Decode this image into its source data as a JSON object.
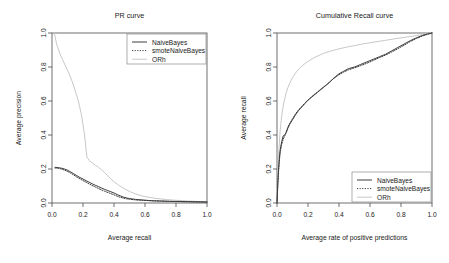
{
  "figure": {
    "background": "#ffffff",
    "panels": 2
  },
  "colors": {
    "naive_bayes": "#3d3d3d",
    "smote_naive_bayes": "#3d3d3d",
    "orh": "#c8c8c8",
    "axis": "#4d4d4d",
    "text": "#1a1a1a",
    "legend_border": "#8c8c8c"
  },
  "legend": {
    "entries": [
      {
        "label": "NaiveBayes",
        "style": "solid",
        "color_key": "naive_bayes"
      },
      {
        "label": "smoteNaiveBayes",
        "style": "dotted",
        "color_key": "smote_naive_bayes"
      },
      {
        "label": "ORh",
        "style": "solid",
        "color_key": "orh"
      }
    ],
    "left_position": "top-right",
    "right_position": "bottom-right"
  },
  "chart_data": [
    {
      "type": "line",
      "title": "PR curve",
      "xlabel": "Average recall",
      "ylabel": "Average precision",
      "xlim": [
        0.0,
        1.0
      ],
      "ylim": [
        0.0,
        1.0
      ],
      "xticks": [
        "0.0",
        "0.2",
        "0.4",
        "0.6",
        "0.8",
        "1.0"
      ],
      "yticks": [
        "0.0",
        "0.2",
        "0.4",
        "0.6",
        "0.8",
        "1.0"
      ],
      "xtick_values": [
        0.0,
        0.2,
        0.4,
        0.6,
        0.8,
        1.0
      ],
      "ytick_values": [
        0.0,
        0.2,
        0.4,
        0.6,
        0.8,
        1.0
      ],
      "grid": false,
      "legend": "top-right",
      "series": [
        {
          "name": "NaiveBayes",
          "style": "solid",
          "color_key": "naive_bayes",
          "x": [
            0.02,
            0.04,
            0.06,
            0.08,
            0.1,
            0.12,
            0.14,
            0.16,
            0.18,
            0.2,
            0.22,
            0.24,
            0.26,
            0.28,
            0.3,
            0.32,
            0.34,
            0.36,
            0.38,
            0.4,
            0.42,
            0.44,
            0.46,
            0.48,
            0.5,
            0.54,
            0.58,
            0.62,
            0.66,
            0.7,
            0.76,
            0.82,
            0.88,
            0.94,
            1.0
          ],
          "y": [
            0.21,
            0.208,
            0.205,
            0.2,
            0.193,
            0.183,
            0.172,
            0.161,
            0.15,
            0.141,
            0.131,
            0.122,
            0.113,
            0.104,
            0.096,
            0.088,
            0.08,
            0.073,
            0.066,
            0.059,
            0.05,
            0.042,
            0.035,
            0.03,
            0.026,
            0.021,
            0.018,
            0.015,
            0.013,
            0.012,
            0.01,
            0.009,
            0.008,
            0.007,
            0.006
          ]
        },
        {
          "name": "smoteNaiveBayes",
          "style": "dotted",
          "color_key": "smote_naive_bayes",
          "x": [
            0.02,
            0.04,
            0.06,
            0.08,
            0.1,
            0.12,
            0.14,
            0.16,
            0.18,
            0.2,
            0.22,
            0.24,
            0.26,
            0.28,
            0.3,
            0.32,
            0.34,
            0.36,
            0.38,
            0.4,
            0.42,
            0.44,
            0.46,
            0.48,
            0.5,
            0.54,
            0.58,
            0.62,
            0.66,
            0.7,
            0.76,
            0.82,
            0.88,
            0.94,
            1.0
          ],
          "y": [
            0.206,
            0.204,
            0.2,
            0.194,
            0.186,
            0.176,
            0.165,
            0.153,
            0.142,
            0.132,
            0.122,
            0.112,
            0.103,
            0.094,
            0.085,
            0.077,
            0.069,
            0.062,
            0.055,
            0.048,
            0.04,
            0.034,
            0.029,
            0.025,
            0.022,
            0.018,
            0.016,
            0.014,
            0.012,
            0.011,
            0.009,
            0.008,
            0.007,
            0.006,
            0.005
          ]
        },
        {
          "name": "ORh",
          "style": "solid",
          "color_key": "orh",
          "x": [
            0.015,
            0.03,
            0.05,
            0.07,
            0.09,
            0.11,
            0.13,
            0.15,
            0.17,
            0.19,
            0.21,
            0.225,
            0.24,
            0.26,
            0.28,
            0.3,
            0.32,
            0.34,
            0.36,
            0.38,
            0.4,
            0.43,
            0.46,
            0.5,
            0.54,
            0.58,
            0.62,
            0.68,
            0.74,
            0.8,
            0.87,
            0.94,
            1.0
          ],
          "y": [
            1.0,
            0.935,
            0.88,
            0.84,
            0.8,
            0.762,
            0.715,
            0.66,
            0.6,
            0.52,
            0.4,
            0.27,
            0.25,
            0.235,
            0.222,
            0.21,
            0.195,
            0.178,
            0.16,
            0.142,
            0.125,
            0.105,
            0.088,
            0.068,
            0.053,
            0.042,
            0.034,
            0.026,
            0.02,
            0.016,
            0.012,
            0.009,
            0.007
          ]
        }
      ]
    },
    {
      "type": "line",
      "title": "Cumulative Recall curve",
      "xlabel": "Average rate of positive predictions",
      "ylabel": "Average recall",
      "xlim": [
        0.0,
        1.0
      ],
      "ylim": [
        0.0,
        1.0
      ],
      "xticks": [
        "0.0",
        "0.2",
        "0.4",
        "0.6",
        "0.8",
        "1.0"
      ],
      "yticks": [
        "0.0",
        "0.2",
        "0.4",
        "0.6",
        "0.8",
        "1.0"
      ],
      "xtick_values": [
        0.0,
        0.2,
        0.4,
        0.6,
        0.8,
        1.0
      ],
      "ytick_values": [
        0.0,
        0.2,
        0.4,
        0.6,
        0.8,
        1.0
      ],
      "grid": false,
      "legend": "bottom-right",
      "series": [
        {
          "name": "NaiveBayes",
          "style": "solid",
          "color_key": "naive_bayes",
          "x": [
            0.0,
            0.005,
            0.01,
            0.015,
            0.02,
            0.03,
            0.04,
            0.05,
            0.06,
            0.07,
            0.08,
            0.1,
            0.12,
            0.14,
            0.16,
            0.18,
            0.2,
            0.22,
            0.24,
            0.26,
            0.28,
            0.3,
            0.32,
            0.34,
            0.36,
            0.38,
            0.4,
            0.43,
            0.46,
            0.5,
            0.54,
            0.58,
            0.62,
            0.66,
            0.7,
            0.74,
            0.78,
            0.82,
            0.86,
            0.9,
            0.94,
            0.97,
            1.0
          ],
          "y": [
            0.0,
            0.11,
            0.2,
            0.26,
            0.31,
            0.36,
            0.395,
            0.4,
            0.415,
            0.44,
            0.46,
            0.49,
            0.52,
            0.545,
            0.565,
            0.585,
            0.605,
            0.62,
            0.635,
            0.65,
            0.665,
            0.68,
            0.695,
            0.71,
            0.73,
            0.745,
            0.76,
            0.775,
            0.79,
            0.8,
            0.815,
            0.83,
            0.845,
            0.86,
            0.875,
            0.895,
            0.915,
            0.935,
            0.955,
            0.972,
            0.986,
            0.994,
            1.0
          ]
        },
        {
          "name": "smoteNaiveBayes",
          "style": "dotted",
          "color_key": "smote_naive_bayes",
          "x": [
            0.0,
            0.005,
            0.01,
            0.015,
            0.02,
            0.03,
            0.04,
            0.05,
            0.06,
            0.07,
            0.08,
            0.1,
            0.12,
            0.14,
            0.16,
            0.18,
            0.2,
            0.22,
            0.24,
            0.26,
            0.28,
            0.3,
            0.32,
            0.34,
            0.36,
            0.38,
            0.4,
            0.43,
            0.46,
            0.5,
            0.54,
            0.58,
            0.62,
            0.66,
            0.7,
            0.74,
            0.78,
            0.82,
            0.86,
            0.9,
            0.94,
            0.97,
            1.0
          ],
          "y": [
            0.0,
            0.1,
            0.185,
            0.245,
            0.295,
            0.345,
            0.375,
            0.395,
            0.42,
            0.445,
            0.465,
            0.495,
            0.525,
            0.548,
            0.568,
            0.588,
            0.606,
            0.622,
            0.638,
            0.652,
            0.668,
            0.682,
            0.697,
            0.712,
            0.728,
            0.742,
            0.755,
            0.77,
            0.783,
            0.795,
            0.808,
            0.822,
            0.838,
            0.855,
            0.87,
            0.888,
            0.908,
            0.928,
            0.95,
            0.968,
            0.983,
            0.992,
            1.0
          ]
        },
        {
          "name": "ORh",
          "style": "solid",
          "color_key": "orh",
          "x": [
            0.0,
            0.005,
            0.01,
            0.02,
            0.03,
            0.04,
            0.05,
            0.06,
            0.07,
            0.08,
            0.09,
            0.1,
            0.12,
            0.14,
            0.16,
            0.18,
            0.2,
            0.23,
            0.26,
            0.3,
            0.34,
            0.38,
            0.42,
            0.46,
            0.5,
            0.55,
            0.6,
            0.65,
            0.7,
            0.76,
            0.82,
            0.88,
            0.94,
            1.0
          ],
          "y": [
            0.0,
            0.15,
            0.28,
            0.42,
            0.51,
            0.57,
            0.615,
            0.65,
            0.678,
            0.7,
            0.72,
            0.737,
            0.765,
            0.788,
            0.805,
            0.82,
            0.833,
            0.85,
            0.864,
            0.88,
            0.892,
            0.902,
            0.911,
            0.919,
            0.926,
            0.935,
            0.943,
            0.95,
            0.957,
            0.966,
            0.974,
            0.982,
            0.991,
            1.0
          ]
        }
      ]
    }
  ]
}
